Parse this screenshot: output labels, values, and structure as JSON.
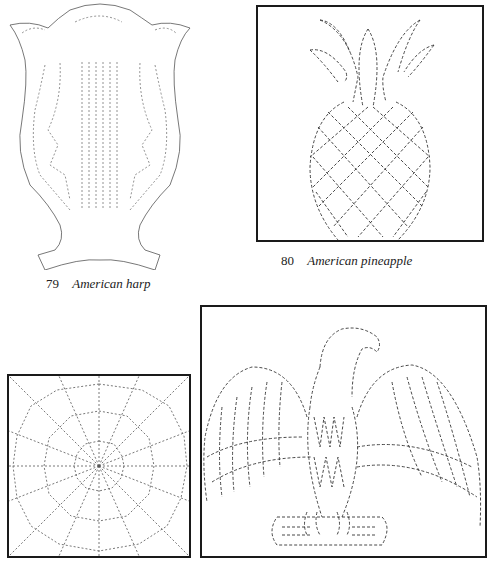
{
  "figures": [
    {
      "number": "79",
      "title": "American harp"
    },
    {
      "number": "80",
      "title": "American pineapple"
    },
    {
      "number": "",
      "title": ""
    },
    {
      "number": "",
      "title": ""
    }
  ],
  "page": {
    "background": "#ffffff",
    "ink": "#1a1a1a"
  }
}
